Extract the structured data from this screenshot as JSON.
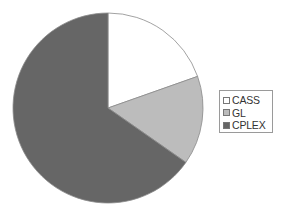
{
  "chart_data": {
    "type": "pie",
    "title": "",
    "categories": [
      "CASS",
      "GL",
      "CPLEX"
    ],
    "values": [
      19.6,
      15.1,
      65.3
    ],
    "unit": "percent (estimated)",
    "colors": [
      "#ffffff",
      "#bcbcbc",
      "#666666"
    ],
    "start_angle_deg": 0,
    "direction": "clockwise",
    "legend_position": "right"
  },
  "legend": {
    "items": [
      {
        "label": "CASS",
        "color": "#ffffff"
      },
      {
        "label": "GL",
        "color": "#bcbcbc"
      },
      {
        "label": "CPLEX",
        "color": "#666666"
      }
    ]
  }
}
